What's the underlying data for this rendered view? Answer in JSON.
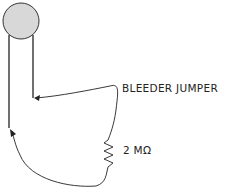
{
  "diagram": {
    "labels": {
      "jumper": "BLEEDER JUMPER",
      "resistor": "2 MΩ"
    },
    "colors": {
      "stroke": "#222222",
      "probe_fill": "#d8d8d8",
      "background": "#ffffff"
    }
  }
}
